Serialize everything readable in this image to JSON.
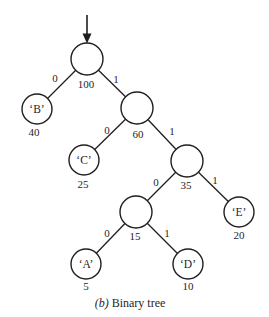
{
  "figure": {
    "caption": {
      "index": "(b)",
      "title": " Binary tree"
    },
    "icons": {
      "root_pointer": "down-arrow"
    },
    "colors": {
      "ink": "#1f1f1f",
      "background": "#ffffff"
    }
  },
  "tree": {
    "type": "binary-tree",
    "nodes": [
      {
        "id": "root",
        "char": "",
        "weight": "100"
      },
      {
        "id": "B",
        "char": "‘B’",
        "weight": "40"
      },
      {
        "id": "n60",
        "char": "",
        "weight": "60"
      },
      {
        "id": "C",
        "char": "‘C’",
        "weight": "25"
      },
      {
        "id": "n35",
        "char": "",
        "weight": "35"
      },
      {
        "id": "n15",
        "char": "",
        "weight": "15"
      },
      {
        "id": "E",
        "char": "‘E’",
        "weight": "20"
      },
      {
        "id": "A",
        "char": "‘A’",
        "weight": "5"
      },
      {
        "id": "D",
        "char": "‘D’",
        "weight": "10"
      }
    ],
    "edges": [
      {
        "from": "root",
        "to": "B",
        "bit": "0"
      },
      {
        "from": "root",
        "to": "n60",
        "bit": "1"
      },
      {
        "from": "n60",
        "to": "C",
        "bit": "0"
      },
      {
        "from": "n60",
        "to": "n35",
        "bit": "1"
      },
      {
        "from": "n35",
        "to": "n15",
        "bit": "0"
      },
      {
        "from": "n35",
        "to": "E",
        "bit": "1"
      },
      {
        "from": "n15",
        "to": "A",
        "bit": "0"
      },
      {
        "from": "n15",
        "to": "D",
        "bit": "1"
      }
    ]
  }
}
